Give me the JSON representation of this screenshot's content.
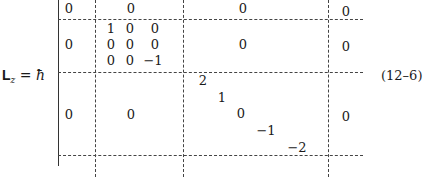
{
  "equation": {
    "lhs_symbol": "L",
    "lhs_subscript": "z",
    "equals": " = ",
    "factor": "ħ",
    "number": "(12–6)"
  },
  "matrix": {
    "block_rows": [
      "1×1",
      "3×3",
      "5×5"
    ],
    "cells": [
      {
        "id": "r1c1",
        "text": "0",
        "x": 69,
        "y": 2
      },
      {
        "id": "r1c2",
        "text": "0",
        "x": 131,
        "y": 2
      },
      {
        "id": "r1c3",
        "text": "0",
        "x": 243,
        "y": 2
      },
      {
        "id": "r1c4",
        "text": "0",
        "x": 346,
        "y": 5
      },
      {
        "id": "r2c1",
        "text": "0",
        "x": 69,
        "y": 38
      },
      {
        "id": "r2c3",
        "text": "0",
        "x": 243,
        "y": 38
      },
      {
        "id": "r2c4",
        "text": "0",
        "x": 346,
        "y": 40
      },
      {
        "id": "b2_11",
        "text": "1",
        "x": 111,
        "y": 22
      },
      {
        "id": "b2_12",
        "text": "0",
        "x": 130,
        "y": 22
      },
      {
        "id": "b2_13",
        "text": "0",
        "x": 155,
        "y": 22
      },
      {
        "id": "b2_21",
        "text": "0",
        "x": 111,
        "y": 38
      },
      {
        "id": "b2_22",
        "text": "0",
        "x": 130,
        "y": 38
      },
      {
        "id": "b2_23",
        "text": "0",
        "x": 155,
        "y": 38
      },
      {
        "id": "b2_31",
        "text": "0",
        "x": 111,
        "y": 54
      },
      {
        "id": "b2_32",
        "text": "0",
        "x": 130,
        "y": 54
      },
      {
        "id": "b2_33",
        "text": "−1",
        "x": 153,
        "y": 54
      },
      {
        "id": "r3c1",
        "text": "0",
        "x": 69,
        "y": 108
      },
      {
        "id": "r3c2",
        "text": "0",
        "x": 131,
        "y": 108
      },
      {
        "id": "r3c4",
        "text": "0",
        "x": 346,
        "y": 110
      },
      {
        "id": "b3_11",
        "text": "2",
        "x": 203,
        "y": 74
      },
      {
        "id": "b3_22",
        "text": "1",
        "x": 222,
        "y": 91
      },
      {
        "id": "b3_33",
        "text": "0",
        "x": 241,
        "y": 107
      },
      {
        "id": "b3_44",
        "text": "−1",
        "x": 266,
        "y": 124
      },
      {
        "id": "b3_55",
        "text": "−2",
        "x": 297,
        "y": 141
      }
    ]
  }
}
